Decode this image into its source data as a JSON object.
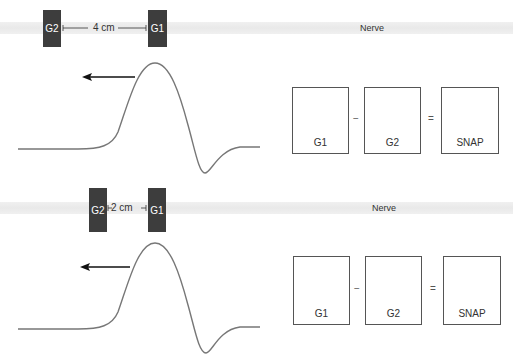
{
  "colors": {
    "electrode": "#3d3d3d",
    "waveform": "#777777",
    "arrow": "#111111",
    "box_border": "#555555",
    "nerve_band": "#ececec"
  },
  "panels": [
    {
      "nerve_label": "Nerve",
      "electrodes": {
        "reference": "G2",
        "active": "G1"
      },
      "distance_label": "4 cm",
      "propagation_arrow": "arrow-left-icon",
      "equation": {
        "terms": [
          {
            "label": "G1",
            "trace": "full-biphasic"
          },
          {
            "label": "G2",
            "trace": "flat"
          },
          {
            "label": "SNAP",
            "trace": "full-biphasic"
          }
        ],
        "operators": [
          "−",
          "="
        ]
      }
    },
    {
      "nerve_label": "Nerve",
      "electrodes": {
        "reference": "G2",
        "active": "G1"
      },
      "distance_label": "2 cm",
      "propagation_arrow": "arrow-left-icon",
      "equation": {
        "terms": [
          {
            "label": "G1",
            "trace": "full-biphasic"
          },
          {
            "label": "G2",
            "trace": "rising-onset"
          },
          {
            "label": "SNAP",
            "trace": "reduced-biphasic"
          }
        ],
        "operators": [
          "−",
          "="
        ]
      }
    }
  ]
}
